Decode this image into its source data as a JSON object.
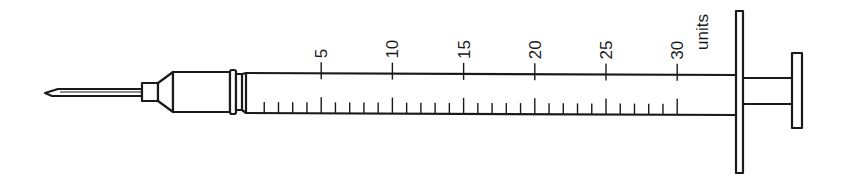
{
  "diagram": {
    "unit_label": "units",
    "scale": {
      "major_ticks": [
        {
          "value": 5,
          "label": "5"
        },
        {
          "value": 10,
          "label": "10"
        },
        {
          "value": 15,
          "label": "15"
        },
        {
          "value": 20,
          "label": "20"
        },
        {
          "value": 25,
          "label": "25"
        },
        {
          "value": 30,
          "label": "30"
        }
      ],
      "min": 0,
      "max": 30,
      "minor_step": 1,
      "major_step": 5
    },
    "parts": [
      "needle",
      "hub",
      "barrel",
      "flange",
      "plunger",
      "thumb-rest"
    ],
    "stroke_color": "#1a1a1a"
  }
}
